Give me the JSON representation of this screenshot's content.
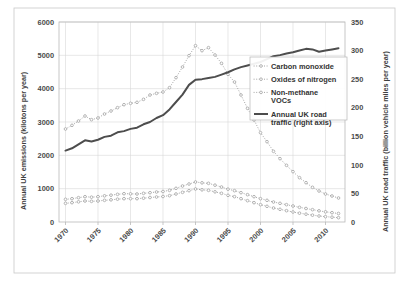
{
  "chart_data": {
    "type": "line",
    "title": "",
    "xlabel": "",
    "ylabel": "Annual UK emissions (kilotons per year)",
    "y2label": "Annual UK road traffic (billion vehicle miles per year)",
    "x": [
      1970,
      1971,
      1972,
      1973,
      1974,
      1975,
      1976,
      1977,
      1978,
      1979,
      1980,
      1981,
      1982,
      1983,
      1984,
      1985,
      1986,
      1987,
      1988,
      1989,
      1990,
      1991,
      1992,
      1993,
      1994,
      1995,
      1996,
      1997,
      1998,
      1999,
      2000,
      2001,
      2002,
      2003,
      2004,
      2005,
      2006,
      2007,
      2008,
      2009,
      2010,
      2011,
      2012
    ],
    "xlim": [
      1969,
      2013
    ],
    "ylim": [
      0,
      6000
    ],
    "y2lim": [
      0,
      350
    ],
    "yticks": [
      0,
      1000,
      2000,
      3000,
      4000,
      5000,
      6000
    ],
    "y2ticks": [
      0,
      50,
      100,
      150,
      200,
      250,
      300,
      350
    ],
    "xticks": [
      1970,
      1975,
      1980,
      1985,
      1990,
      1995,
      2000,
      2005,
      2010
    ],
    "grid": true,
    "legend_position": "center-right",
    "series": [
      {
        "name": "Carbon monoxide",
        "axis": "left",
        "style": "dotted-marker",
        "color": "#9a9a9a",
        "values": [
          2790,
          2900,
          3030,
          3180,
          3070,
          3120,
          3240,
          3330,
          3430,
          3520,
          3560,
          3590,
          3680,
          3810,
          3860,
          3900,
          4030,
          4330,
          4650,
          4990,
          5290,
          5140,
          5230,
          5010,
          4760,
          4430,
          4200,
          3810,
          3410,
          3060,
          2680,
          2410,
          2120,
          1900,
          1700,
          1510,
          1330,
          1180,
          1040,
          930,
          840,
          780,
          720
        ]
      },
      {
        "name": "Oxides of nitrogen",
        "axis": "left",
        "style": "dotted-marker",
        "color": "#9a9a9a",
        "values": [
          680,
          700,
          730,
          760,
          745,
          760,
          785,
          805,
          830,
          850,
          845,
          840,
          860,
          880,
          900,
          915,
          950,
          1010,
          1080,
          1140,
          1200,
          1175,
          1160,
          1105,
          1050,
          985,
          940,
          880,
          820,
          760,
          700,
          650,
          600,
          560,
          520,
          480,
          440,
          405,
          370,
          335,
          305,
          280,
          255
        ]
      },
      {
        "name": "Non-methane VOCs",
        "axis": "left",
        "style": "dotted-marker",
        "color": "#9a9a9a",
        "values": [
          560,
          580,
          605,
          630,
          620,
          630,
          650,
          665,
          685,
          700,
          700,
          700,
          715,
          735,
          750,
          765,
          790,
          840,
          890,
          940,
          990,
          965,
          950,
          905,
          860,
          800,
          760,
          700,
          640,
          580,
          520,
          470,
          420,
          380,
          340,
          300,
          265,
          235,
          205,
          180,
          160,
          145,
          130
        ]
      },
      {
        "name": "Annual UK road traffic (right axis)",
        "axis": "right",
        "style": "solid",
        "color": "#4d4d4d",
        "values": [
          125,
          129,
          136,
          143,
          141,
          144,
          149,
          151,
          157,
          159,
          163,
          165,
          171,
          175,
          182,
          187,
          197,
          210,
          223,
          240,
          249,
          250,
          252,
          254,
          258,
          262,
          267,
          271,
          274,
          277,
          280,
          285,
          290,
          292,
          295,
          297,
          300,
          303,
          302,
          298,
          300,
          302,
          304
        ]
      }
    ]
  },
  "legend": {
    "items": [
      {
        "label": "Carbon monoxide",
        "style": "dotted-marker",
        "color": "#9a9a9a"
      },
      {
        "label": "Oxides of nitrogen",
        "style": "dotted-marker",
        "color": "#9a9a9a"
      },
      {
        "label": "Non-methane",
        "label2": "VOCs",
        "style": "dotted-marker",
        "color": "#9a9a9a"
      },
      {
        "label": "Annual UK road",
        "label2": "traffic (right axis)",
        "style": "solid",
        "color": "#4d4d4d"
      }
    ]
  }
}
